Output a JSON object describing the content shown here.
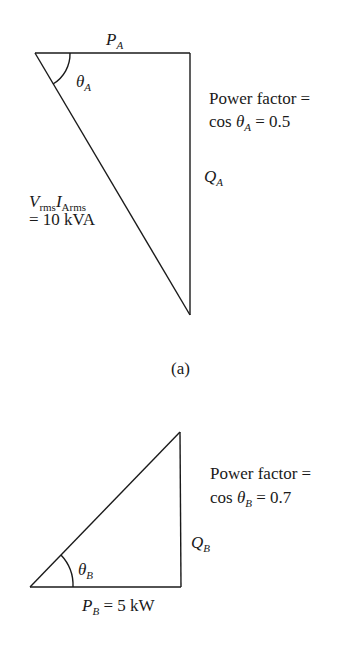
{
  "diagram": {
    "type": "power-triangles",
    "caption_a": "(a)",
    "triangle_a": {
      "top_label_main": "P",
      "top_label_sub": "A",
      "angle_main": "θ",
      "angle_sub": "A",
      "side_label_main": "Q",
      "side_label_sub": "A",
      "hyp_v": "V",
      "hyp_v_sub": "rms",
      "hyp_i": "I",
      "hyp_i_sub": "Arms",
      "hyp_value": "= 10 kVA",
      "pf_line1": "Power factor =",
      "pf_cos": "cos ",
      "pf_theta": "θ",
      "pf_theta_sub": "A",
      "pf_value": " = 0.5"
    },
    "triangle_b": {
      "bottom_label_main": "P",
      "bottom_label_sub": "B",
      "bottom_value": " = 5 kW",
      "angle_main": "θ",
      "angle_sub": "B",
      "side_label_main": "Q",
      "side_label_sub": "B",
      "pf_line1": "Power factor =",
      "pf_cos": "cos ",
      "pf_theta": "θ",
      "pf_theta_sub": "B",
      "pf_value": " = 0.7"
    },
    "line_color": "#1a1a1a"
  }
}
